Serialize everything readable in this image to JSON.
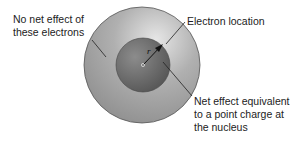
{
  "diagram": {
    "labels": {
      "no_net_effect": [
        "No net effect of",
        "these electrons"
      ],
      "electron_location": "Electron location",
      "net_effect": [
        "Net effect equivalent",
        "to a point charge at",
        "the nucleus"
      ],
      "radius_symbol": "r"
    },
    "colors": {
      "outer_shell": "#a9a9a9",
      "inner_sphere": "#6f6f6f",
      "leader_lines": "#222222"
    }
  }
}
